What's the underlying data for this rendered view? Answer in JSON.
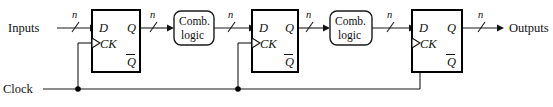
{
  "diagram": {
    "bus_width_label": "n",
    "io": {
      "inputs_label": "Inputs",
      "outputs_label": "Outputs",
      "clock_label": "Clock"
    },
    "flipflops": [
      {
        "id": "ff1",
        "d_label": "D",
        "q_label": "Q",
        "ck_label": "CK",
        "qbar_label": "Q"
      },
      {
        "id": "ff2",
        "d_label": "D",
        "q_label": "Q",
        "ck_label": "CK",
        "qbar_label": "Q"
      },
      {
        "id": "ff3",
        "d_label": "D",
        "q_label": "Q",
        "ck_label": "CK",
        "qbar_label": "Q"
      }
    ],
    "combinational_blocks": [
      {
        "id": "comb1",
        "line1": "Comb.",
        "line2": "logic"
      },
      {
        "id": "comb2",
        "line1": "Comb.",
        "line2": "logic"
      }
    ],
    "bus_labels": [
      "n",
      "n",
      "n",
      "n",
      "n",
      "n"
    ],
    "colors": {
      "background": "#ffffff",
      "wire": "#1a1a1a",
      "flipflop_border": "#000000",
      "comb_border": "#1a1a1a",
      "text": "#111111"
    }
  }
}
